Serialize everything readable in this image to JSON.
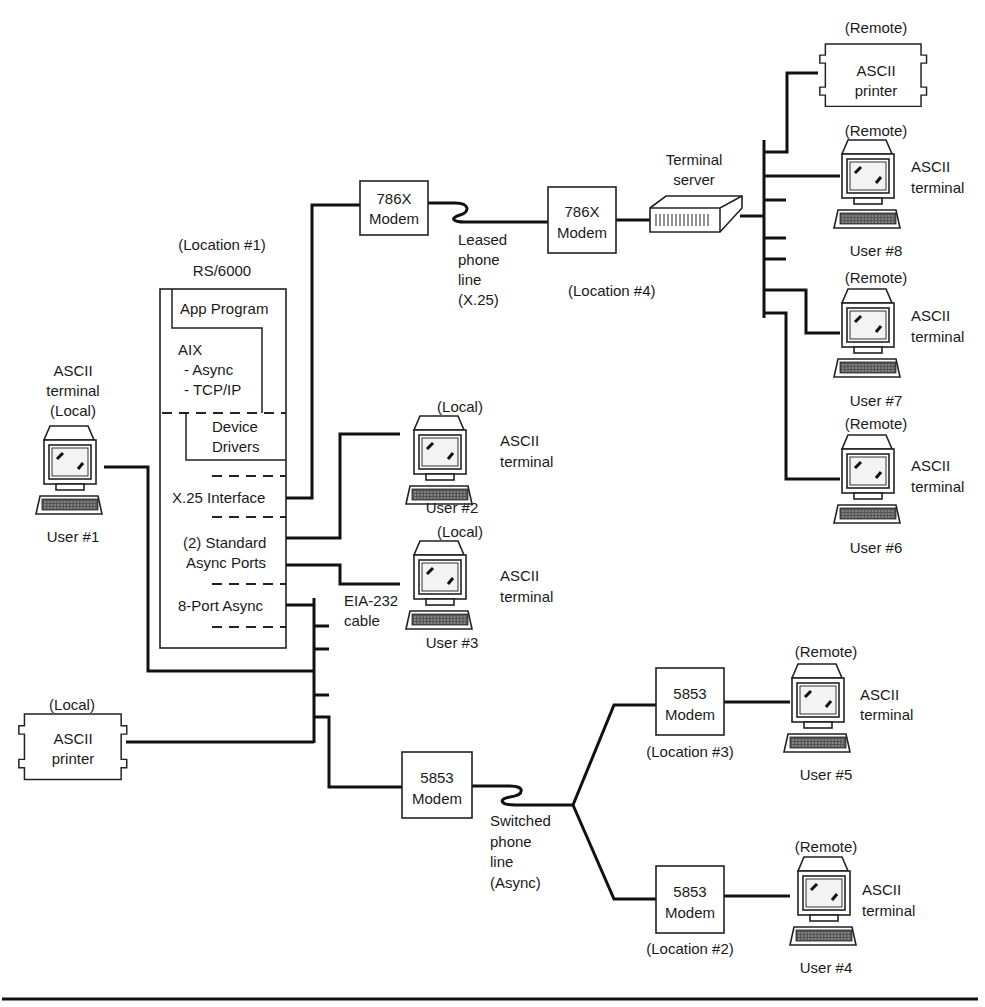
{
  "rs6000": {
    "location": "(Location #1)",
    "title": "RS/6000",
    "app_program": "App Program",
    "aix": [
      "AIX",
      "- Async",
      "- TCP/IP"
    ],
    "device_drivers": [
      "Device",
      "Drivers"
    ],
    "x25_interface": "X.25 Interface",
    "standard_ports": [
      "(2) Standard",
      "Async Ports"
    ],
    "eight_port": "8-Port Async"
  },
  "modems": {
    "m786_local": [
      "786X",
      "Modem"
    ],
    "m786_remote": [
      "786X",
      "Modem"
    ],
    "m5853_local": [
      "5853",
      "Modem"
    ],
    "m5853_loc3": [
      "5853",
      "Modem"
    ],
    "m5853_loc2": [
      "5853",
      "Modem"
    ]
  },
  "lines": {
    "leased": [
      "Leased",
      "phone",
      "line",
      "(X.25)"
    ],
    "switched": [
      "Switched",
      "phone",
      "line",
      "(Async)"
    ],
    "eia": [
      "EIA-232",
      "cable"
    ]
  },
  "locations": {
    "loc2": "(Location #2)",
    "loc3": "(Location #3)",
    "loc4": "(Location #4)"
  },
  "terminal_server": [
    "Terminal",
    "server"
  ],
  "printers": {
    "local": {
      "tag": "(Local)",
      "label": [
        "ASCII",
        "printer"
      ]
    },
    "remote": {
      "tag": "(Remote)",
      "label": [
        "ASCII",
        "printer"
      ]
    }
  },
  "terminals": {
    "user1": {
      "label": [
        "ASCII",
        "terminal",
        "(Local)"
      ],
      "user": "User #1"
    },
    "user2": {
      "tag": "(Local)",
      "label": [
        "ASCII",
        "terminal"
      ],
      "user": "User #2"
    },
    "user3": {
      "tag": "(Local)",
      "label": [
        "ASCII",
        "terminal"
      ],
      "user": "User #3"
    },
    "user4": {
      "tag": "(Remote)",
      "label": [
        "ASCII",
        "terminal"
      ],
      "user": "User #4"
    },
    "user5": {
      "tag": "(Remote)",
      "label": [
        "ASCII",
        "terminal"
      ],
      "user": "User #5"
    },
    "user6": {
      "tag": "(Remote)",
      "label": [
        "ASCII",
        "terminal"
      ],
      "user": "User #6"
    },
    "user7": {
      "tag": "(Remote)",
      "label": [
        "ASCII",
        "terminal"
      ],
      "user": "User #7"
    },
    "user8": {
      "tag": "(Remote)",
      "label": [
        "ASCII",
        "terminal"
      ],
      "user": "User #8"
    }
  }
}
